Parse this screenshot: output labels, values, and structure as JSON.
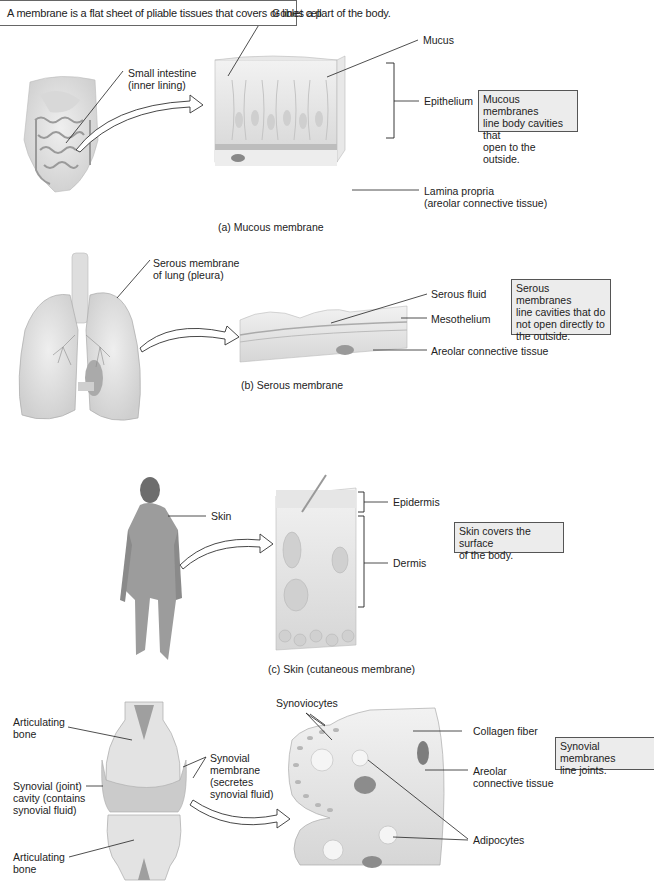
{
  "header": {
    "definition": "A membrane is a flat sheet of pliable tissues that covers or lines a part of the body."
  },
  "panels": [
    {
      "id": "a",
      "caption": "(a)  Mucous membrane",
      "source_label": [
        "Small intestine",
        "(inner lining)"
      ],
      "labels": {
        "goblet_cell": "Goblet cell",
        "mucus": "Mucus",
        "epithelium": "Epithelium",
        "lamina_propria": [
          "Lamina propria",
          "(areolar connective tissue)"
        ]
      },
      "callout": [
        "Mucous membranes",
        "line body cavities that",
        "open to the outside."
      ]
    },
    {
      "id": "b",
      "caption": "(b)  Serous membrane",
      "source_label": [
        "Serous membrane",
        "of lung (pleura)"
      ],
      "labels": {
        "serous_fluid": "Serous fluid",
        "mesothelium": "Mesothelium",
        "areolar": "Areolar connective tissue"
      },
      "callout": [
        "Serous membranes",
        "line cavities that do",
        "not open directly to",
        "the outside."
      ]
    },
    {
      "id": "c",
      "caption": "(c)  Skin (cutaneous membrane)",
      "source_label": [
        "Skin"
      ],
      "labels": {
        "epidermis": "Epidermis",
        "dermis": "Dermis"
      },
      "callout": [
        "Skin covers the surface",
        "of the body."
      ]
    },
    {
      "id": "d",
      "source_labels": {
        "articulating_bone_top": [
          "Articulating",
          "bone"
        ],
        "synovial_cavity": [
          "Synovial (joint)",
          "cavity (contains",
          "synovial fluid)"
        ],
        "articulating_bone_bottom": [
          "Articulating",
          "bone"
        ],
        "synovial_membrane": [
          "Synovial",
          "membrane",
          "(secretes",
          "synovial fluid)"
        ]
      },
      "labels": {
        "synoviocytes": "Synoviocytes",
        "collagen_fiber": "Collagen fiber",
        "areolar": [
          "Areolar",
          "connective tissue"
        ],
        "adipocytes": "Adipocytes"
      },
      "callout": [
        "Synovial membranes",
        "line joints."
      ]
    }
  ],
  "colors": {
    "callout_bg": "#ececec",
    "callout_border": "#555555",
    "tissue_fill": "#e4e4e4",
    "tissue_shade": "#c9c9c9",
    "line": "#222222"
  }
}
